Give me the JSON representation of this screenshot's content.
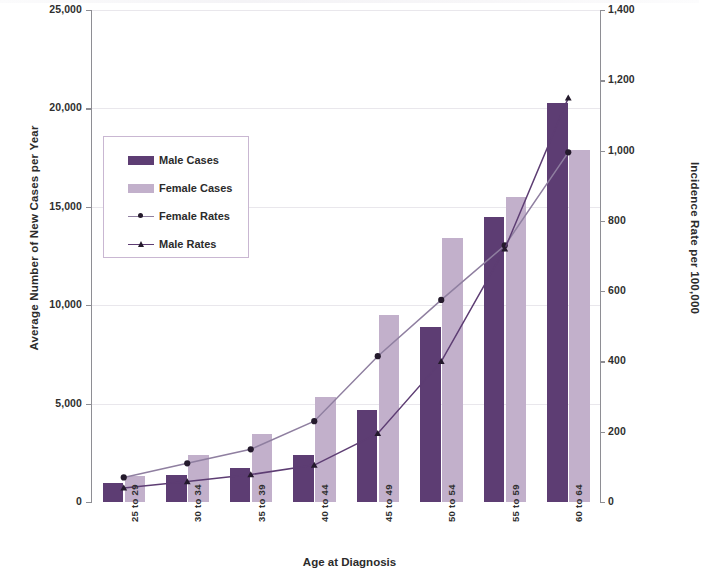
{
  "chart_data": {
    "type": "bar",
    "title": "",
    "xlabel": "Age at Diagnosis",
    "ylabel": "Average Number of New Cases per Year",
    "ylabel_secondary": "Incidence Rate per 100,000",
    "categories": [
      "25 to 29",
      "30 to 34",
      "35 to 39",
      "40 to 44",
      "45 to 49",
      "50 to 54",
      "55 to 59",
      "60 to 64"
    ],
    "ylim": [
      0,
      25000
    ],
    "ylim_secondary": [
      0,
      1400
    ],
    "yticks": [
      "0",
      "5,000",
      "10,000",
      "15,000",
      "20,000",
      "25,000"
    ],
    "ytick_values": [
      0,
      5000,
      10000,
      15000,
      20000,
      25000
    ],
    "yticks_secondary": [
      "0",
      "200",
      "400",
      "600",
      "800",
      "1,000",
      "1,200",
      "1,400"
    ],
    "ytick_values_secondary": [
      0,
      200,
      400,
      600,
      800,
      1000,
      1200,
      1400
    ],
    "grid": true,
    "legend_position": "upper left",
    "series": [
      {
        "name": "Male Cases",
        "type": "bar",
        "axis": "left",
        "color": "#5d3d73",
        "values": [
          950,
          1350,
          1750,
          2400,
          4700,
          8900,
          14500,
          20300
        ]
      },
      {
        "name": "Female Cases",
        "type": "bar",
        "axis": "left",
        "color": "#c2b0cb",
        "values": [
          1300,
          2400,
          3450,
          5350,
          9500,
          13400,
          15500,
          17900
        ]
      },
      {
        "name": "Female Rates",
        "type": "line",
        "axis": "right",
        "color": "#8f7fa0",
        "marker": "circle",
        "values": [
          70,
          110,
          150,
          230,
          415,
          575,
          730,
          995
        ]
      },
      {
        "name": "Male Rates",
        "type": "line",
        "axis": "right",
        "color": "#5d3d73",
        "marker": "triangle",
        "values": [
          40,
          58,
          78,
          105,
          195,
          400,
          720,
          1150
        ]
      }
    ]
  },
  "legend": {
    "items": [
      {
        "label": "Male Cases",
        "kind": "swatch",
        "swatch_class": "sw-male"
      },
      {
        "label": "Female Cases",
        "kind": "swatch",
        "swatch_class": "sw-female"
      },
      {
        "label": "Female Rates",
        "kind": "line",
        "marker": "circle"
      },
      {
        "label": "Male Rates",
        "kind": "line",
        "marker": "triangle"
      }
    ]
  },
  "colors": {
    "male": "#5d3d73",
    "female": "#c2b0cb",
    "female_rate_line": "#8f7fa0",
    "male_rate_line": "#5d3d73",
    "grid": "#e9e7ec",
    "axis": "#8e8e94",
    "legend_border": "#c9b7d2"
  }
}
